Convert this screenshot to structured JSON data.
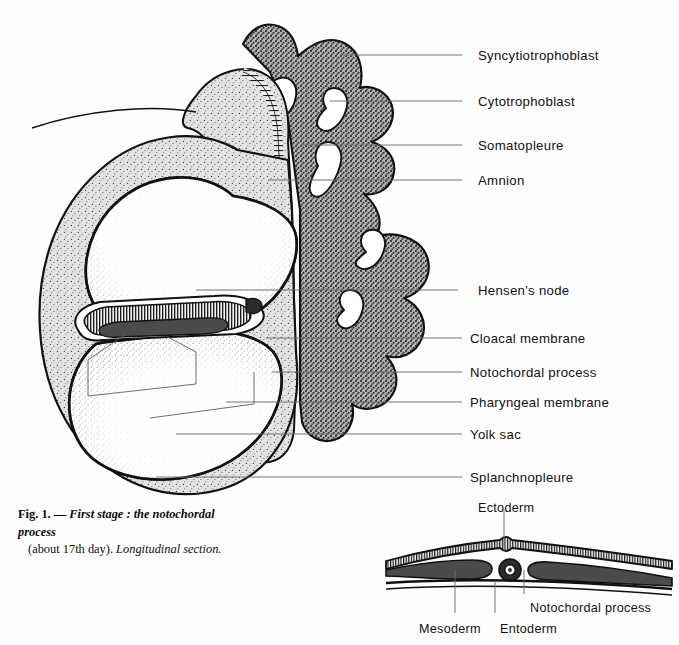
{
  "figure": {
    "title": "First stage : the notochordal process",
    "caption": {
      "fig_number": "Fig. 1.",
      "dash": "—",
      "title_italic": "First stage : the notochordal process",
      "detail": "(about 17th day).",
      "section_note": "Longitudinal section.",
      "full_text": "Fig. 1. — First stage : the notochordal process (about 17th day). Longitudinal section."
    }
  },
  "main_labels": [
    {
      "id": "syncytiotrophoblast",
      "text": "Syncytiotrophoblast",
      "x": 478,
      "y": 48,
      "leader": {
        "x1": 462,
        "y1": 55,
        "x2": 340,
        "y2": 55
      }
    },
    {
      "id": "cytotrophoblast",
      "text": "Cytotrophoblast",
      "x": 478,
      "y": 94,
      "leader": {
        "x1": 462,
        "y1": 101,
        "x2": 330,
        "y2": 101
      }
    },
    {
      "id": "somatopleure",
      "text": "Somatopleure",
      "x": 478,
      "y": 138,
      "leader": {
        "x1": 462,
        "y1": 145,
        "x2": 300,
        "y2": 145
      }
    },
    {
      "id": "amnion",
      "text": "Amnion",
      "x": 478,
      "y": 173,
      "leader": {
        "x1": 462,
        "y1": 180,
        "x2": 268,
        "y2": 180
      }
    },
    {
      "id": "hensens-node",
      "text": "Hensen's node",
      "x": 478,
      "y": 283,
      "leader": {
        "x1": 458,
        "y1": 290,
        "x2": 196,
        "y2": 290
      }
    },
    {
      "id": "cloacal-membrane",
      "text": "Cloacal membrane",
      "x": 470,
      "y": 331,
      "leader": {
        "x1": 462,
        "y1": 338,
        "x2": 266,
        "y2": 338
      }
    },
    {
      "id": "notochordal-process",
      "text": "Notochordal process",
      "x": 470,
      "y": 365,
      "leader": {
        "x1": 462,
        "y1": 372,
        "x2": 272,
        "y2": 372
      }
    },
    {
      "id": "pharyngeal-membrane",
      "text": "Pharyngeal membrane",
      "x": 470,
      "y": 395,
      "leader": {
        "x1": 462,
        "y1": 402,
        "x2": 226,
        "y2": 402
      }
    },
    {
      "id": "yolk-sac",
      "text": "Yolk sac",
      "x": 470,
      "y": 427,
      "leader": {
        "x1": 462,
        "y1": 434,
        "x2": 176,
        "y2": 434
      }
    },
    {
      "id": "splanchnopleure",
      "text": "Splanchnopleure",
      "x": 470,
      "y": 470,
      "leader": {
        "x1": 462,
        "y1": 477,
        "x2": 156,
        "y2": 477
      }
    }
  ],
  "inset_labels": [
    {
      "id": "ectoderm",
      "text": "Ectoderm",
      "x": 478,
      "y": 501,
      "leader": {
        "x1": 504,
        "y1": 509,
        "x2": 504,
        "y2": 551
      }
    },
    {
      "id": "notochordal-process",
      "text": "Notochordal process",
      "x": 530,
      "y": 601,
      "leader": {
        "x1": 524,
        "y1": 594,
        "x2": 524,
        "y2": 570
      }
    },
    {
      "id": "mesoderm",
      "text": "Mesoderm",
      "x": 419,
      "y": 622,
      "leader": {
        "x1": 455,
        "y1": 613,
        "x2": 455,
        "y2": 570
      }
    },
    {
      "id": "entoderm",
      "text": "Entoderm",
      "x": 500,
      "y": 622,
      "leader": {
        "x1": 495,
        "y1": 613,
        "x2": 495,
        "y2": 582
      }
    }
  ],
  "colors": {
    "background": "#fdfdfd",
    "ink": "#111111",
    "syncytiotrophoblast_fill": "#9c9c9c",
    "cytotrophoblast_fill": "#d8d8d8",
    "mesoderm_fill": "#4b4b4b",
    "leader_line": "#6d6d6d",
    "stipple": "#2a2a2a"
  },
  "structures": {
    "amniotic_cavity": "amniotic cavity",
    "yolk_sac_cavity": "yolk sac cavity",
    "embryonic_disc": "embryonic disc",
    "chorionic_villi": "chorionic villi",
    "connecting_stalk": "connecting stalk",
    "extraembryonic_coelom": "extraembryonic coelom"
  }
}
